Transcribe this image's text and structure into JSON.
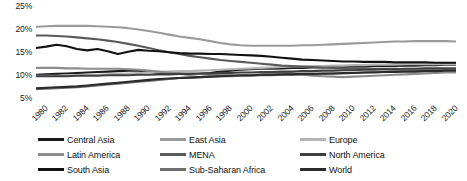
{
  "chart_data": {
    "type": "line",
    "title": "",
    "subtitle": "",
    "xlabel": "",
    "ylabel": "",
    "xlim": [
      1980,
      2021
    ],
    "ylim": [
      4,
      25
    ],
    "grid": false,
    "legend_position": "bottom",
    "y_ticks": [
      "25%",
      "20%",
      "15%",
      "10%",
      "5%"
    ],
    "y_tick_values": [
      25,
      20,
      15,
      10,
      5
    ],
    "x_tick_labels": [
      "1980",
      "1982",
      "1984",
      "1986",
      "1988",
      "1990",
      "1992",
      "1994",
      "1996",
      "1998",
      "2000",
      "2002",
      "2004",
      "2006",
      "2008",
      "2010",
      "2012",
      "2014",
      "2016",
      "2018",
      "2020"
    ],
    "x": [
      1980,
      1981,
      1982,
      1983,
      1984,
      1985,
      1986,
      1987,
      1988,
      1989,
      1990,
      1991,
      1992,
      1993,
      1994,
      1995,
      1996,
      1997,
      1998,
      1999,
      2000,
      2001,
      2002,
      2003,
      2004,
      2005,
      2006,
      2007,
      2008,
      2009,
      2010,
      2011,
      2012,
      2013,
      2014,
      2015,
      2016,
      2017,
      2018,
      2019,
      2020,
      2021
    ],
    "series": [
      {
        "name": "Central Asia",
        "color": "#1a1a1a",
        "values": [
          10.1,
          10.2,
          10.3,
          10.4,
          10.5,
          10.6,
          10.7,
          10.8,
          10.9,
          11.0,
          11.0,
          10.8,
          10.5,
          10.4,
          10.3,
          10.2,
          10.3,
          10.5,
          10.8,
          11.0,
          11.2,
          11.3,
          11.4,
          11.4,
          11.5,
          11.6,
          11.6,
          11.7,
          11.7,
          11.8,
          11.8,
          11.9,
          11.9,
          12.0,
          12.0,
          12.0,
          12.1,
          12.1,
          12.2,
          12.2,
          12.3,
          12.3
        ]
      },
      {
        "name": "East Asia",
        "color": "#9a9a9a",
        "values": [
          20.5,
          20.6,
          20.7,
          20.7,
          20.7,
          20.7,
          20.6,
          20.5,
          20.4,
          20.2,
          19.9,
          19.6,
          19.2,
          18.8,
          18.4,
          18.1,
          17.8,
          17.4,
          17.0,
          16.7,
          16.5,
          16.4,
          16.4,
          16.4,
          16.4,
          16.4,
          16.5,
          16.5,
          16.6,
          16.7,
          16.8,
          16.9,
          17.0,
          17.1,
          17.2,
          17.3,
          17.3,
          17.4,
          17.4,
          17.4,
          17.4,
          17.3
        ]
      },
      {
        "name": "Europe",
        "color": "#b4b4b4",
        "values": [
          9.9,
          9.9,
          9.9,
          10.0,
          10.0,
          10.1,
          10.1,
          10.2,
          10.3,
          10.4,
          10.5,
          10.6,
          10.7,
          10.8,
          10.9,
          10.9,
          11.0,
          11.1,
          11.2,
          11.3,
          11.4,
          11.5,
          11.6,
          11.7,
          11.8,
          11.9,
          11.9,
          12.0,
          12.0,
          12.1,
          12.1,
          12.2,
          12.2,
          12.3,
          12.3,
          12.3,
          12.4,
          12.4,
          12.4,
          12.4,
          12.4,
          12.4
        ]
      },
      {
        "name": "Latin America",
        "color": "#8c8c8c",
        "values": [
          11.6,
          11.6,
          11.6,
          11.5,
          11.5,
          11.4,
          11.4,
          11.4,
          11.4,
          11.3,
          11.2,
          11.0,
          10.8,
          10.6,
          10.4,
          10.3,
          10.3,
          10.2,
          10.1,
          10.0,
          9.9,
          10.0,
          10.2,
          10.4,
          10.6,
          10.4,
          10.1,
          9.9,
          9.8,
          9.7,
          9.6,
          9.7,
          9.8,
          9.9,
          10.0,
          10.1,
          10.2,
          10.3,
          10.4,
          10.5,
          10.6,
          10.6
        ]
      },
      {
        "name": "MENA",
        "color": "#5a5a5a",
        "values": [
          18.6,
          18.6,
          18.5,
          18.4,
          18.2,
          18.0,
          17.8,
          17.5,
          17.2,
          16.8,
          16.4,
          15.9,
          15.4,
          15.0,
          14.6,
          14.2,
          13.9,
          13.6,
          13.3,
          13.1,
          12.9,
          12.7,
          12.5,
          12.3,
          12.1,
          12.0,
          11.9,
          11.8,
          11.7,
          11.6,
          11.5,
          11.5,
          11.5,
          11.4,
          11.4,
          11.4,
          11.3,
          11.3,
          11.3,
          11.3,
          11.2,
          11.2
        ]
      },
      {
        "name": "North America",
        "color": "#3f3f3f",
        "values": [
          9.8,
          9.8,
          9.8,
          9.8,
          9.9,
          9.9,
          9.9,
          10.0,
          10.0,
          10.0,
          10.1,
          10.1,
          10.2,
          10.2,
          10.3,
          10.3,
          10.4,
          10.4,
          10.5,
          10.5,
          10.6,
          10.6,
          10.7,
          10.7,
          10.8,
          10.8,
          10.9,
          10.9,
          11.0,
          11.0,
          11.1,
          11.1,
          11.2,
          11.2,
          11.3,
          11.3,
          11.4,
          11.4,
          11.5,
          11.5,
          11.5,
          11.5
        ]
      },
      {
        "name": "South Asia",
        "color": "#111111",
        "values": [
          15.9,
          16.2,
          16.6,
          16.3,
          15.7,
          15.4,
          15.7,
          15.2,
          14.6,
          15.1,
          15.5,
          15.3,
          15.2,
          15.0,
          14.8,
          14.7,
          14.7,
          14.6,
          14.6,
          14.5,
          14.4,
          14.3,
          14.2,
          14.0,
          13.8,
          13.6,
          13.4,
          13.3,
          13.2,
          13.1,
          13.0,
          13.0,
          12.9,
          12.9,
          12.9,
          12.8,
          12.8,
          12.8,
          12.8,
          12.7,
          12.7,
          12.7
        ]
      },
      {
        "name": "Sub-Saharan Africa",
        "color": "#6e6e6e",
        "values": [
          7.0,
          7.1,
          7.2,
          7.3,
          7.4,
          7.6,
          7.8,
          8.0,
          8.2,
          8.4,
          8.6,
          8.8,
          9.0,
          9.2,
          9.4,
          9.5,
          9.6,
          9.7,
          9.8,
          9.8,
          9.9,
          9.9,
          10.0,
          10.0,
          10.1,
          10.1,
          10.2,
          10.2,
          10.3,
          10.4,
          10.4,
          10.5,
          10.6,
          10.7,
          10.8,
          10.9,
          11.0,
          11.0,
          11.1,
          11.1,
          11.2,
          11.2
        ]
      },
      {
        "name": "World",
        "color": "#2b2b2b",
        "values": [
          7.2,
          7.3,
          7.4,
          7.5,
          7.6,
          7.8,
          8.0,
          8.2,
          8.4,
          8.6,
          8.8,
          9.0,
          9.2,
          9.3,
          9.4,
          9.5,
          9.6,
          9.7,
          9.8,
          9.9,
          10.0,
          10.0,
          10.1,
          10.1,
          10.2,
          10.2,
          10.3,
          10.3,
          10.4,
          10.4,
          10.5,
          10.5,
          10.6,
          10.6,
          10.7,
          10.7,
          10.8,
          10.8,
          10.9,
          10.9,
          11.0,
          11.0
        ]
      }
    ],
    "legend_rows": [
      [
        "Central Asia",
        "East Asia",
        "Europe"
      ],
      [
        "Latin America",
        "MENA",
        "North America"
      ],
      [
        "South Asia",
        "Sub-Saharan Africa",
        "World"
      ]
    ]
  }
}
